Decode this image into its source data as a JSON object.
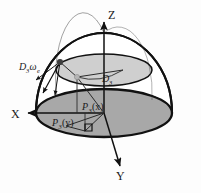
{
  "figure": {
    "background_color": "#fdfdfd",
    "stroke_color": "#1a1a1a",
    "axes": {
      "z_label": "Z",
      "x_label": "X",
      "y_label": "Y"
    },
    "labels": {
      "vector_base": "D",
      "vector_sub": "3",
      "vector_omega": "ω",
      "vector_omega_sub": "e",
      "radius_base": "D",
      "radius_sub": "3",
      "proj_x_base": "P",
      "proj_x_sub": "3",
      "proj_x_arg": "(x)",
      "proj_y_base": "P",
      "proj_y_sub": "3",
      "proj_y_arg": "(y)"
    },
    "colors": {
      "dome_fill": "#ffffff",
      "upper_disk_fill": "#cfcfcf",
      "base_disk_fill": "#a8a8a8",
      "outline": "#111111",
      "thin_line": "#2a2a2a",
      "node_dark": "#3d3d3d",
      "node_light": "#b5b5b5"
    },
    "geometry": {
      "center_x": 104,
      "center_y": 113,
      "base_rx": 68,
      "base_ry": 24,
      "upper_cy": 70,
      "upper_rx": 48,
      "upper_ry": 16,
      "dome_top_y": 33
    }
  }
}
